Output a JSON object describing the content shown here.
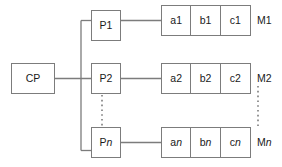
{
  "diagram": {
    "colors": {
      "line": "#7c7c7c",
      "text": "#1a1a1a",
      "background": "#ffffff"
    },
    "central": {
      "label": "CP"
    },
    "processors": [
      {
        "label_prefix": "P",
        "label_suffix": "1",
        "suffix_italic": false
      },
      {
        "label_prefix": "P",
        "label_suffix": "2",
        "suffix_italic": false
      },
      {
        "label_prefix": "P",
        "label_suffix": "n",
        "suffix_italic": true
      }
    ],
    "memories": [
      {
        "label_prefix": "M",
        "label_suffix": "1",
        "suffix_italic": false,
        "cells": [
          {
            "prefix": "a",
            "suffix": "1",
            "suffix_italic": false
          },
          {
            "prefix": "b",
            "suffix": "1",
            "suffix_italic": false
          },
          {
            "prefix": "c",
            "suffix": "1",
            "suffix_italic": false
          }
        ]
      },
      {
        "label_prefix": "M",
        "label_suffix": "2",
        "suffix_italic": false,
        "cells": [
          {
            "prefix": "a",
            "suffix": "2",
            "suffix_italic": false
          },
          {
            "prefix": "b",
            "suffix": "2",
            "suffix_italic": false
          },
          {
            "prefix": "c",
            "suffix": "2",
            "suffix_italic": false
          }
        ]
      },
      {
        "label_prefix": "M",
        "label_suffix": "n",
        "suffix_italic": true,
        "cells": [
          {
            "prefix": "a",
            "suffix": "n",
            "suffix_italic": true
          },
          {
            "prefix": "b",
            "suffix": "n",
            "suffix_italic": true
          },
          {
            "prefix": "c",
            "suffix": "n",
            "suffix_italic": true
          }
        ]
      }
    ],
    "ellipses": [
      {
        "name": "processor-ellipsis",
        "orientation": "vertical"
      },
      {
        "name": "memory-ellipsis",
        "orientation": "vertical"
      }
    ]
  }
}
